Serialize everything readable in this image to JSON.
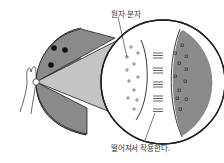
{
  "diagram": {
    "labels": {
      "atoms_molecules": "원자·분자",
      "act_at_distance": "떨어져서 작용한다."
    },
    "colors": {
      "dark_fill": "#8a8a8a",
      "light_cone": "#c4c4c4",
      "outline": "#222222",
      "background": "#ffffff"
    },
    "elements": {
      "left_body": "grey hemisphere with three black dots",
      "hand": "hand with finger touching surface",
      "magnified_view": "circle showing atoms/molecules with interaction lines"
    }
  }
}
